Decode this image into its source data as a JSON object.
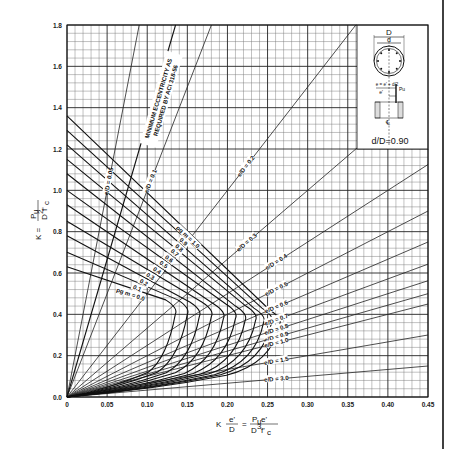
{
  "chart_data": {
    "type": "line",
    "title": "",
    "xlabel": "K e'/D = Pu e' / (D^3 f'c)",
    "xlabel_parts": {
      "k": "K",
      "e_prime": "e'",
      "d": "D",
      "eq": "=",
      "pu_e": "P",
      "pu_sub": "u",
      "pu_e_tail": "e'",
      "d3": "D",
      "d3_sup": "3",
      "fc": "f'",
      "fc_sub": "c"
    },
    "ylabel": "K = Pu / (D^2 f'c)",
    "ylabel_parts": {
      "k_eq": "K =",
      "num": "P",
      "num_sub": "u",
      "den": "D",
      "den_sup": "2",
      "den_f": "f'",
      "den_sub": "c"
    },
    "xlim": [
      0,
      0.45
    ],
    "ylim": [
      0,
      1.8
    ],
    "x_ticks": [
      "0",
      "0.05",
      "0.10",
      "0.15",
      "0.20",
      "0.25",
      "0.30",
      "0.35",
      "0.40",
      "0.45"
    ],
    "x_tick_values": [
      0,
      0.05,
      0.1,
      0.15,
      0.2,
      0.25,
      0.3,
      0.35,
      0.4,
      0.45
    ],
    "y_ticks": [
      "0.0",
      "0.2",
      "0.4",
      "0.6",
      "0.8",
      "1.0",
      "1.2",
      "1.4",
      "1.6",
      "1.8"
    ],
    "y_tick_values": [
      0,
      0.2,
      0.4,
      0.6,
      0.8,
      1.0,
      1.2,
      1.4,
      1.6,
      1.8
    ],
    "grid": true,
    "grid_minor_step_x": 0.01,
    "grid_minor_step_y": 0.04,
    "legend": "none",
    "interaction_curves": [
      {
        "label": "ρg m = 0.0",
        "pm": 0.0,
        "k0": 0.63,
        "knee": [
          0.135,
          0.4
        ]
      },
      {
        "label": "0.1",
        "pm": 0.1,
        "k0": 0.7,
        "knee": [
          0.15,
          0.4
        ]
      },
      {
        "label": "0.2",
        "pm": 0.2,
        "k0": 0.78,
        "knee": [
          0.165,
          0.39
        ]
      },
      {
        "label": "0.3",
        "pm": 0.3,
        "k0": 0.85,
        "knee": [
          0.18,
          0.39
        ]
      },
      {
        "label": "0.4",
        "pm": 0.4,
        "k0": 0.93,
        "knee": [
          0.195,
          0.38
        ]
      },
      {
        "label": "0.5",
        "pm": 0.5,
        "k0": 1.0,
        "knee": [
          0.21,
          0.38
        ]
      },
      {
        "label": "0.6",
        "pm": 0.6,
        "k0": 1.08,
        "knee": [
          0.222,
          0.37
        ]
      },
      {
        "label": "0.7",
        "pm": 0.7,
        "k0": 1.15,
        "knee": [
          0.235,
          0.37
        ]
      },
      {
        "label": "0.8",
        "pm": 0.8,
        "k0": 1.22,
        "knee": [
          0.245,
          0.36
        ]
      },
      {
        "label": "0.9",
        "pm": 0.9,
        "k0": 1.29,
        "knee": [
          0.255,
          0.36
        ]
      },
      {
        "label": "ρg m = 1.0",
        "pm": 1.0,
        "k0": 1.36,
        "knee": [
          0.265,
          0.35
        ]
      }
    ],
    "eccentricity_lines": [
      {
        "label": "e/D = 0.05",
        "eD": 0.05
      },
      {
        "label": "e/D = 0.1",
        "eD": 0.1
      },
      {
        "label": "e/D = 0.2",
        "eD": 0.2
      },
      {
        "label": "e/D = 0.3",
        "eD": 0.3
      },
      {
        "label": "e/D = 0.4",
        "eD": 0.4
      },
      {
        "label": "e/D = 0.5",
        "eD": 0.5
      },
      {
        "label": "e/D = 0.6",
        "eD": 0.6
      },
      {
        "label": "e/D = 0.7",
        "eD": 0.7
      },
      {
        "label": "e/D = 0.8",
        "eD": 0.8
      },
      {
        "label": "e/D = 0.9",
        "eD": 0.9
      },
      {
        "label": "e/D = 1.0",
        "eD": 1.0
      },
      {
        "label": "e/D = 1.5",
        "eD": 1.5
      },
      {
        "label": "e/D = 3.0",
        "eD": 3.0
      }
    ],
    "min_eccentricity_line": {
      "label_line1": "MINIMUM ECCENTRICITY AS",
      "label_line2": "REQUIRED BY ACI 318-56",
      "slope_k_per_x": 13.3
    },
    "annotations": [
      "d/D=0.90"
    ]
  },
  "inset": {
    "title": "d/D=0.90",
    "labels": {
      "D": "D",
      "d": "d",
      "e_eq": "e = e' + d/2",
      "e_prime": "e'",
      "Pu": "Pu",
      "cl": "℄"
    }
  }
}
